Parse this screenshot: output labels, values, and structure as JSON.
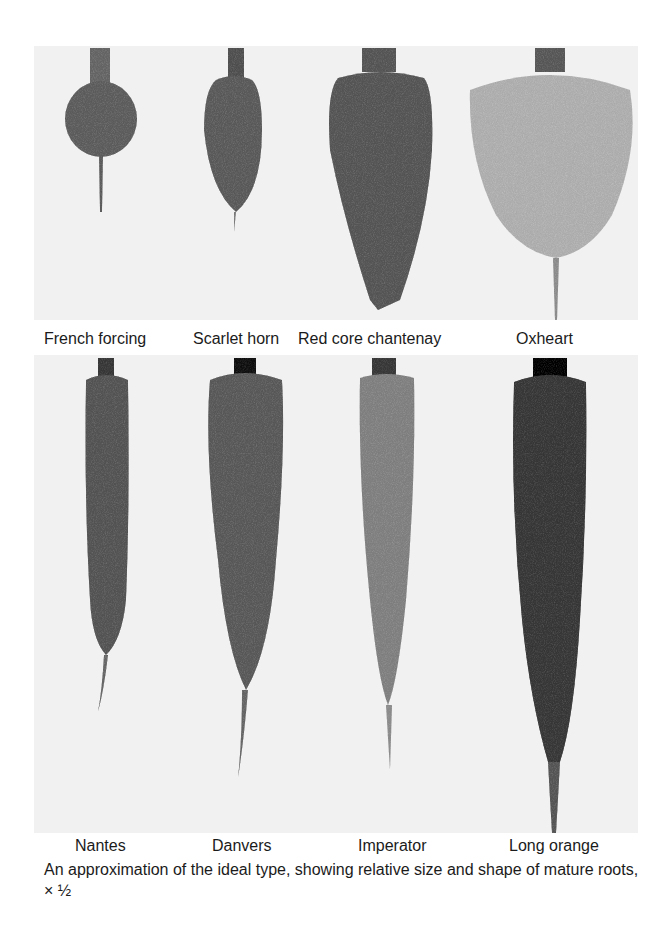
{
  "figure": {
    "top_row": {
      "labels": [
        "French forcing",
        "Scarlet horn",
        "Red core chantenay",
        "Oxheart"
      ]
    },
    "bottom_row": {
      "labels": [
        "Nantes",
        "Danvers",
        "Imperator",
        "Long orange"
      ]
    },
    "caption": "An approximation of the ideal type, showing relative size and shape of mature roots, × ½"
  }
}
